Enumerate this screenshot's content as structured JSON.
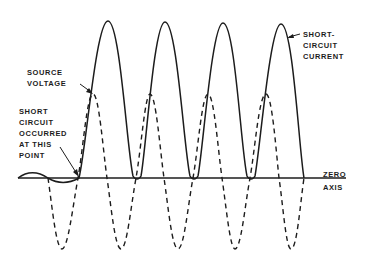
{
  "diagram": {
    "title": "",
    "labels": {
      "source_voltage": [
        "SOURCE",
        "VOLTAGE"
      ],
      "short_circuit_point": [
        "SHORT",
        "CIRCUIT",
        "OCCURRED",
        "AT THIS",
        "POINT"
      ],
      "short_circuit_current": [
        "SHORT-",
        "CIRCUIT",
        "CURRENT"
      ],
      "zero_axis": [
        "ZERO",
        "AXIS"
      ]
    },
    "series": [
      {
        "name": "Source voltage",
        "style": "dashed",
        "color": "#1c1c1c"
      },
      {
        "name": "Short-circuit current",
        "style": "solid",
        "color": "#1c1c1c"
      }
    ],
    "colors": {
      "ink": "#1c1c1c",
      "background": "#ffffff"
    }
  }
}
